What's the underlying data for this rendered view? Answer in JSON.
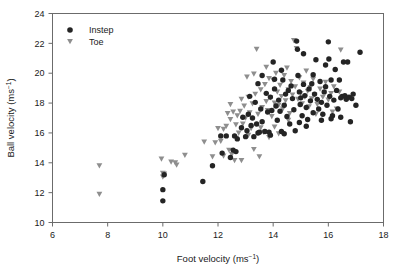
{
  "chart_data": {
    "type": "scatter",
    "title": "",
    "xlabel": "Foot velocity (ms−1)",
    "xlabel_base": "Foot velocity (ms",
    "xlabel_sup": "−1",
    "xlabel_tail": ")",
    "ylabel_base": "Ball velocity (ms",
    "ylabel_sup": "−1",
    "ylabel_tail": ")",
    "xlim": [
      6,
      18
    ],
    "ylim": [
      10,
      24
    ],
    "xticks": [
      6,
      8,
      10,
      12,
      14,
      16,
      18
    ],
    "yticks": [
      10,
      12,
      14,
      16,
      18,
      20,
      22,
      24
    ],
    "xtick_labels": [
      "6",
      "8",
      "10",
      "12",
      "14",
      "16",
      "18"
    ],
    "ytick_labels": [
      "10",
      "12",
      "14",
      "16",
      "18",
      "20",
      "22",
      "24"
    ],
    "grid": false,
    "legend_position": "top-left",
    "colors": {
      "instep": "#242424",
      "toe": "#8e8e8e",
      "frame": "#6b6b6b",
      "text": "#1a1a1a",
      "background": "#ffffff"
    },
    "series": [
      {
        "name": "Instep",
        "marker": "circle",
        "color": "#242424",
        "points": [
          [
            10.0,
            11.45
          ],
          [
            10.0,
            12.2
          ],
          [
            10.05,
            13.2
          ],
          [
            11.45,
            12.75
          ],
          [
            11.8,
            13.8
          ],
          [
            12.1,
            15.8
          ],
          [
            12.15,
            14.65
          ],
          [
            12.3,
            15.8
          ],
          [
            12.45,
            14.35
          ],
          [
            12.55,
            14.85
          ],
          [
            12.6,
            15.8
          ],
          [
            12.65,
            14.75
          ],
          [
            12.7,
            15.6
          ],
          [
            12.85,
            16.35
          ],
          [
            13.0,
            15.75
          ],
          [
            13.05,
            16.15
          ],
          [
            13.1,
            17.25
          ],
          [
            13.2,
            16.5
          ],
          [
            13.25,
            17.0
          ],
          [
            13.3,
            15.75
          ],
          [
            13.35,
            18.05
          ],
          [
            13.4,
            16.6
          ],
          [
            13.45,
            16.0
          ],
          [
            13.5,
            16.05
          ],
          [
            13.55,
            17.6
          ],
          [
            13.6,
            16.75
          ],
          [
            13.7,
            16.1
          ],
          [
            13.75,
            18.65
          ],
          [
            13.8,
            17.4
          ],
          [
            13.85,
            16.05
          ],
          [
            13.9,
            18.4
          ],
          [
            13.95,
            17.5
          ],
          [
            14.0,
            20.75
          ],
          [
            14.05,
            18.95
          ],
          [
            14.1,
            17.8
          ],
          [
            14.15,
            16.85
          ],
          [
            14.2,
            18.2
          ],
          [
            14.25,
            17.45
          ],
          [
            14.3,
            16.1
          ],
          [
            14.35,
            19.55
          ],
          [
            14.4,
            17.85
          ],
          [
            14.45,
            18.6
          ],
          [
            14.5,
            17.1
          ],
          [
            14.55,
            18.85
          ],
          [
            14.6,
            16.6
          ],
          [
            14.65,
            19.15
          ],
          [
            14.7,
            18.3
          ],
          [
            14.75,
            17.55
          ],
          [
            14.8,
            16.15
          ],
          [
            14.85,
            22.15
          ],
          [
            14.88,
            21.6
          ],
          [
            14.9,
            19.85
          ],
          [
            14.95,
            18.75
          ],
          [
            14.98,
            17.9
          ],
          [
            15.0,
            18.35
          ],
          [
            15.05,
            17.15
          ],
          [
            15.1,
            19.25
          ],
          [
            15.15,
            18.5
          ],
          [
            15.2,
            17.7
          ],
          [
            15.25,
            16.9
          ],
          [
            15.3,
            18.95
          ],
          [
            15.35,
            18.15
          ],
          [
            15.4,
            19.3
          ],
          [
            15.45,
            17.35
          ],
          [
            15.5,
            18.6
          ],
          [
            15.55,
            20.9
          ],
          [
            15.6,
            18.25
          ],
          [
            15.65,
            17.6
          ],
          [
            15.7,
            19.45
          ],
          [
            15.75,
            18.05
          ],
          [
            15.8,
            17.25
          ],
          [
            15.85,
            18.75
          ],
          [
            15.9,
            19.1
          ],
          [
            15.95,
            17.85
          ],
          [
            16.0,
            22.1
          ],
          [
            16.02,
            20.95
          ],
          [
            16.05,
            18.45
          ],
          [
            16.1,
            19.55
          ],
          [
            16.15,
            17.15
          ],
          [
            16.2,
            18.2
          ],
          [
            16.25,
            20.25
          ],
          [
            16.3,
            18.85
          ],
          [
            16.35,
            17.6
          ],
          [
            16.4,
            19.55
          ],
          [
            16.45,
            18.35
          ],
          [
            16.5,
            18.45
          ],
          [
            16.55,
            20.75
          ],
          [
            16.6,
            18.5
          ],
          [
            16.65,
            18.25
          ],
          [
            16.7,
            20.75
          ],
          [
            16.75,
            18.4
          ],
          [
            16.8,
            16.75
          ],
          [
            16.85,
            18.3
          ],
          [
            16.9,
            18.6
          ],
          [
            17.0,
            17.85
          ],
          [
            17.15,
            21.4
          ],
          [
            13.6,
            19.85
          ],
          [
            14.3,
            20.2
          ],
          [
            15.1,
            21.3
          ],
          [
            15.45,
            19.9
          ],
          [
            12.9,
            17.05
          ],
          [
            13.15,
            18.45
          ],
          [
            14.4,
            15.95
          ],
          [
            15.2,
            16.45
          ],
          [
            16.1,
            16.95
          ],
          [
            14.05,
            19.6
          ],
          [
            15.75,
            16.85
          ],
          [
            13.45,
            19.3
          ],
          [
            16.45,
            17.05
          ],
          [
            14.95,
            16.7
          ],
          [
            15.9,
            20.55
          ],
          [
            13.9,
            15.85
          ]
        ]
      },
      {
        "name": "Toe",
        "marker": "triangle-down",
        "color": "#8e8e8e",
        "points": [
          [
            7.7,
            11.9
          ],
          [
            7.7,
            13.8
          ],
          [
            9.95,
            14.25
          ],
          [
            10.0,
            13.3
          ],
          [
            10.0,
            13.05
          ],
          [
            10.05,
            13.25
          ],
          [
            10.3,
            14.05
          ],
          [
            10.45,
            14.0
          ],
          [
            10.5,
            13.85
          ],
          [
            10.8,
            14.5
          ],
          [
            11.5,
            15.4
          ],
          [
            11.8,
            14.4
          ],
          [
            12.0,
            16.3
          ],
          [
            12.1,
            15.45
          ],
          [
            12.2,
            16.25
          ],
          [
            12.35,
            17.3
          ],
          [
            12.4,
            14.85
          ],
          [
            12.45,
            16.9
          ],
          [
            12.5,
            14.55
          ],
          [
            12.55,
            17.4
          ],
          [
            12.6,
            14.15
          ],
          [
            12.65,
            16.55
          ],
          [
            12.7,
            17.15
          ],
          [
            12.75,
            16.0
          ],
          [
            12.8,
            17.45
          ],
          [
            12.85,
            18.25
          ],
          [
            12.9,
            16.6
          ],
          [
            12.95,
            17.8
          ],
          [
            13.0,
            17.0
          ],
          [
            13.05,
            19.75
          ],
          [
            13.1,
            18.4
          ],
          [
            13.15,
            17.35
          ],
          [
            13.2,
            16.3
          ],
          [
            13.25,
            17.95
          ],
          [
            13.3,
            19.95
          ],
          [
            13.35,
            18.6
          ],
          [
            13.4,
            21.6
          ],
          [
            13.45,
            17.25
          ],
          [
            13.5,
            14.4
          ],
          [
            13.55,
            18.9
          ],
          [
            13.6,
            17.7
          ],
          [
            13.65,
            16.05
          ],
          [
            13.7,
            19.25
          ],
          [
            13.75,
            18.1
          ],
          [
            13.8,
            17.5
          ],
          [
            13.85,
            19.65
          ],
          [
            13.9,
            18.35
          ],
          [
            13.95,
            17.1
          ],
          [
            14.0,
            19.55
          ],
          [
            14.05,
            18.0
          ],
          [
            14.1,
            20.0
          ],
          [
            14.15,
            18.75
          ],
          [
            14.2,
            17.85
          ],
          [
            14.25,
            19.2
          ],
          [
            14.3,
            18.45
          ],
          [
            14.35,
            17.6
          ],
          [
            14.4,
            19.85
          ],
          [
            14.45,
            18.15
          ],
          [
            14.5,
            20.35
          ],
          [
            14.55,
            18.9
          ],
          [
            14.6,
            17.3
          ],
          [
            14.65,
            19.45
          ],
          [
            14.7,
            18.55
          ],
          [
            14.75,
            22.2
          ],
          [
            14.8,
            19.1
          ],
          [
            14.85,
            21.65
          ],
          [
            14.9,
            18.25
          ],
          [
            14.95,
            19.7
          ],
          [
            15.0,
            18.65
          ],
          [
            15.05,
            17.95
          ],
          [
            15.1,
            19.35
          ],
          [
            15.15,
            18.4
          ],
          [
            15.2,
            20.15
          ],
          [
            15.25,
            18.8
          ],
          [
            15.3,
            17.75
          ],
          [
            15.35,
            19.05
          ],
          [
            15.4,
            18.3
          ],
          [
            15.45,
            19.6
          ],
          [
            15.5,
            18.55
          ],
          [
            15.6,
            17.9
          ],
          [
            15.7,
            18.95
          ],
          [
            15.8,
            18.4
          ],
          [
            15.9,
            19.4
          ],
          [
            16.0,
            18.2
          ],
          [
            16.1,
            18.65
          ],
          [
            16.2,
            19.1
          ],
          [
            16.3,
            17.6
          ],
          [
            16.4,
            18.75
          ],
          [
            16.45,
            21.55
          ],
          [
            16.6,
            18.3
          ],
          [
            12.3,
            16.45
          ],
          [
            12.65,
            15.65
          ],
          [
            13.1,
            15.85
          ],
          [
            13.85,
            15.7
          ],
          [
            14.2,
            15.95
          ],
          [
            12.85,
            14.15
          ],
          [
            13.3,
            14.9
          ],
          [
            12.2,
            14.45
          ],
          [
            11.9,
            15.35
          ],
          [
            14.55,
            16.85
          ],
          [
            15.55,
            17.25
          ],
          [
            16.15,
            17.4
          ],
          [
            13.55,
            16.35
          ],
          [
            14.05,
            16.4
          ],
          [
            12.45,
            17.9
          ],
          [
            13.75,
            20.4
          ]
        ]
      }
    ],
    "legend": [
      {
        "label": "Instep",
        "marker": "circle",
        "color": "#242424"
      },
      {
        "label": "Toe",
        "marker": "triangle-down",
        "color": "#8e8e8e"
      }
    ]
  }
}
